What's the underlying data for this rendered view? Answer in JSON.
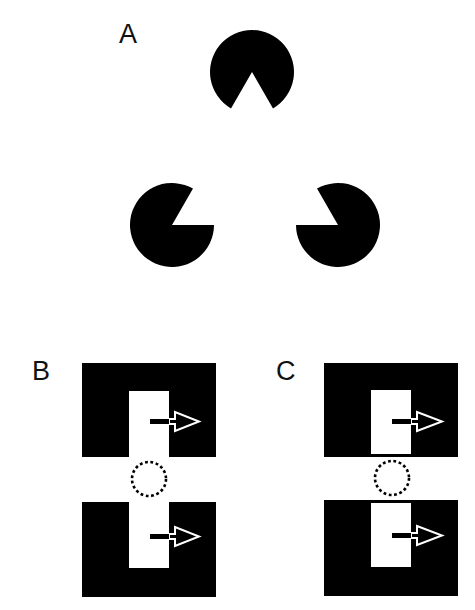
{
  "figure": {
    "background": "#ffffff",
    "ink_color": "#000000",
    "panels": [
      {
        "id": "A",
        "label": "A",
        "description": "Kanizsa illusory triangle formed by three pac-man inducers",
        "inducers": [
          {
            "name": "top",
            "cx": 252,
            "cy": 70,
            "r": 42,
            "notch_direction_deg": 90
          },
          {
            "name": "bottom-left",
            "cx": 172,
            "cy": 225,
            "r": 42,
            "notch_direction_deg": -30
          },
          {
            "name": "bottom-right",
            "cx": 338,
            "cy": 225,
            "r": 42,
            "notch_direction_deg": 210
          }
        ],
        "notch_angle_deg": 60
      },
      {
        "id": "B",
        "label": "B",
        "description": "Two black blocks with open slots (notches open toward gap), arrows pointing right, dotted circle in gap"
      },
      {
        "id": "C",
        "label": "C",
        "description": "Two black blocks with enclosed white rectangles, arrows pointing right, dotted circle in gap"
      }
    ]
  }
}
